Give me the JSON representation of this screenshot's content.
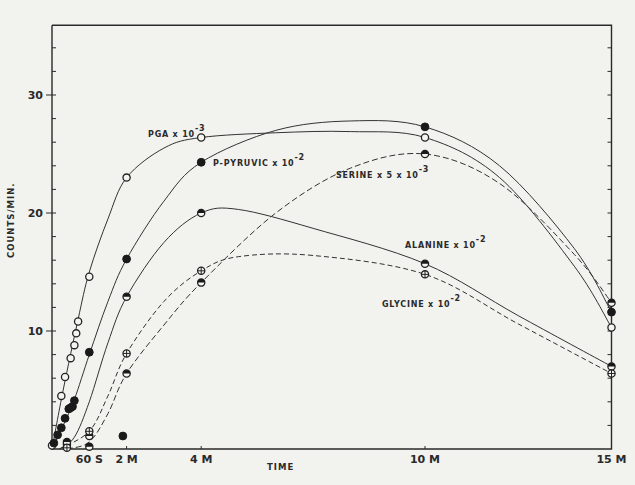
{
  "chart_data": {
    "type": "line",
    "title": "",
    "xlabel": "TIME",
    "ylabel": "COUNTS/MIN.",
    "xlim": [
      0,
      15
    ],
    "ylim": [
      0,
      36
    ],
    "grid": false,
    "legend_position": "inline labels",
    "x_ticks": [
      {
        "t": 1,
        "label": "60 S"
      },
      {
        "t": 2,
        "label": "2 M"
      },
      {
        "t": 4,
        "label": "4 M"
      },
      {
        "t": 10,
        "label": "10 M"
      },
      {
        "t": 15,
        "label": "15 M"
      }
    ],
    "y_ticks": [
      {
        "v": 10,
        "label": "10"
      },
      {
        "v": 20,
        "label": "20"
      },
      {
        "v": 30,
        "label": "30"
      }
    ],
    "series": [
      {
        "name": "PGA x 10^-3",
        "label": "PGA x 10",
        "exp": "-3",
        "marker": "open",
        "dash": "",
        "label_pos": [
          148,
          137
        ],
        "x": [
          0.0,
          0.25,
          0.35,
          0.5,
          0.6,
          0.65,
          0.7,
          1.0,
          2.0,
          4.0,
          10.0,
          15.0
        ],
        "values": [
          0.3,
          4.5,
          6.1,
          7.7,
          8.8,
          9.8,
          10.8,
          14.6,
          23.0,
          26.4,
          26.4,
          10.3
        ],
        "curve": [
          [
            0,
            0
          ],
          [
            0.3,
            5
          ],
          [
            0.7,
            11
          ],
          [
            1,
            15
          ],
          [
            1.5,
            19.5
          ],
          [
            2,
            23
          ],
          [
            3,
            25.5
          ],
          [
            4,
            26.4
          ],
          [
            6,
            26.8
          ],
          [
            8,
            26.9
          ],
          [
            10,
            26.4
          ],
          [
            12,
            23
          ],
          [
            14,
            15.5
          ],
          [
            15,
            10.3
          ]
        ]
      },
      {
        "name": "P-PYRUVIC x 10^-2",
        "label": "P-PYRUVIC x 10",
        "exp": "-2",
        "marker": "filled",
        "dash": "",
        "label_pos": [
          213,
          166
        ],
        "x": [
          0.05,
          0.15,
          0.25,
          0.35,
          0.45,
          0.5,
          0.55,
          0.6,
          1.0,
          2.0,
          4.0,
          10.0,
          15.0
        ],
        "values": [
          0.5,
          1.2,
          1.8,
          2.6,
          3.4,
          3.5,
          3.6,
          4.1,
          8.2,
          16.1,
          24.3,
          27.3,
          11.6
        ],
        "curve": [
          [
            0,
            0
          ],
          [
            0.3,
            2
          ],
          [
            0.6,
            4.2
          ],
          [
            1,
            8
          ],
          [
            1.5,
            12.5
          ],
          [
            2,
            16.1
          ],
          [
            3,
            21
          ],
          [
            4,
            24.3
          ],
          [
            6,
            27
          ],
          [
            8,
            27.8
          ],
          [
            10,
            27.3
          ],
          [
            12,
            24
          ],
          [
            14,
            17
          ],
          [
            15,
            11.6
          ]
        ]
      },
      {
        "name": "SERINE x 5 x 10^-3",
        "label": "SERINE x 5 x 10",
        "exp": "-3",
        "marker": "half",
        "dash": "6,3",
        "label_pos": [
          336,
          178
        ],
        "x": [
          0.4,
          1.0,
          2.0,
          4.0,
          10.0,
          15.0
        ],
        "values": [
          0.4,
          0.2,
          6.4,
          14.1,
          25.0,
          12.4
        ],
        "curve": [
          [
            0.4,
            0
          ],
          [
            1,
            0.6
          ],
          [
            1.5,
            3
          ],
          [
            2,
            6.4
          ],
          [
            3,
            10.5
          ],
          [
            4,
            14.1
          ],
          [
            6,
            20
          ],
          [
            8,
            23.8
          ],
          [
            10,
            25.0
          ],
          [
            12,
            22.5
          ],
          [
            14,
            16.5
          ],
          [
            15,
            12.4
          ]
        ]
      },
      {
        "name": "ALANINE x 10^-2",
        "label": "ALANINE x 10",
        "exp": "-2",
        "marker": "half",
        "dash": "",
        "label_pos": [
          405,
          248
        ],
        "x": [
          0.4,
          1.0,
          2.0,
          4.0,
          10.0,
          15.0
        ],
        "values": [
          0.6,
          1.1,
          12.9,
          20.0,
          15.7,
          7.0
        ],
        "curve": [
          [
            0.2,
            0
          ],
          [
            0.6,
            1
          ],
          [
            1,
            4
          ],
          [
            1.5,
            9
          ],
          [
            2,
            12.9
          ],
          [
            3,
            17.5
          ],
          [
            4,
            20.0
          ],
          [
            5,
            20.3
          ],
          [
            7,
            18.7
          ],
          [
            10,
            15.7
          ],
          [
            12.5,
            11.3
          ],
          [
            15,
            7.0
          ]
        ]
      },
      {
        "name": "GLYCINE x 10^-2",
        "label": "GLYCINE x 10",
        "exp": "-2",
        "marker": "cross",
        "dash": "5,3",
        "label_pos": [
          382,
          307
        ],
        "x": [
          0.4,
          1.0,
          2.0,
          4.0,
          10.0,
          15.0
        ],
        "values": [
          0.1,
          1.5,
          8.1,
          15.1,
          14.8,
          6.4
        ],
        "curve": [
          [
            0.2,
            0
          ],
          [
            1,
            1.5
          ],
          [
            1.5,
            4.5
          ],
          [
            2,
            8.1
          ],
          [
            3,
            12.5
          ],
          [
            4,
            15.1
          ],
          [
            5,
            16.3
          ],
          [
            7,
            16.4
          ],
          [
            10,
            14.8
          ],
          [
            12.5,
            10.6
          ],
          [
            15,
            6.4
          ]
        ]
      }
    ],
    "extra_points": [
      {
        "x": 1.9,
        "value": 1.1,
        "marker": "filled"
      }
    ]
  }
}
